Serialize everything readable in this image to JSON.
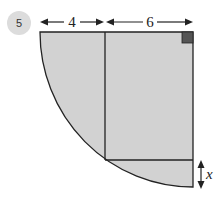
{
  "problem": {
    "number": "5",
    "badge_color": "#dcdcdc"
  },
  "diagram": {
    "type": "quarter-circle-with-inscribed-rectangle",
    "dimensions": {
      "left_width": "4",
      "right_width": "6",
      "unknown_height": "x"
    },
    "colors": {
      "fill": "#d2d2d2",
      "stroke": "#222222",
      "right_angle_marker": "#555555"
    },
    "right_angle_marker": true
  }
}
